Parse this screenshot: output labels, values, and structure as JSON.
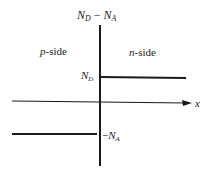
{
  "diagram": {
    "type": "step-junction-doping-profile",
    "y_axis_label": {
      "main": "N",
      "sub1": "D",
      "minus": "−",
      "main2": "N",
      "sub2": "A"
    },
    "x_axis_label": "x",
    "p_side_label": {
      "italic": "p",
      "rest": "-side"
    },
    "n_side_label": {
      "italic": "n",
      "rest": "-side"
    },
    "nd_level_label": {
      "main": "N",
      "sub": "D"
    },
    "na_level_label": {
      "minus": "−",
      "main": "N",
      "sub": "A"
    },
    "colors": {
      "line": "#1a1a1a",
      "text": "#222222",
      "background": "#ffffff"
    }
  }
}
